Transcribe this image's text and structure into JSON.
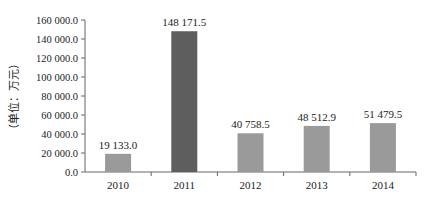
{
  "chart_data": {
    "type": "bar",
    "title": "",
    "xlabel": "",
    "ylabel": "（单位：万元）",
    "categories": [
      "2010",
      "2011",
      "2012",
      "2013",
      "2014"
    ],
    "values": [
      19133.0,
      148171.5,
      40758.5,
      48512.9,
      51479.5
    ],
    "value_labels": [
      "19 133.0",
      "148 171.5",
      "40 758.5",
      "48 512.9",
      "51 479.5"
    ],
    "bar_colors": [
      "#9a9a9a",
      "#5e5e5e",
      "#9a9a9a",
      "#9a9a9a",
      "#9a9a9a"
    ],
    "ylim": [
      0,
      160000
    ],
    "yticks": [
      0,
      20000,
      40000,
      60000,
      80000,
      100000,
      120000,
      140000,
      160000
    ],
    "ytick_labels": [
      "0.0",
      "20 000.0",
      "40 000.0",
      "60 000.0",
      "80 000.0",
      "100 000.0",
      "120 000.0",
      "140 000.0",
      "160 000.0"
    ],
    "grid": false,
    "legend": null
  }
}
